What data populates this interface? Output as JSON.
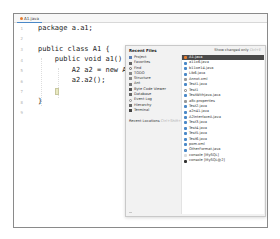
{
  "editor": {
    "tab_label": "A1.java",
    "line_numbers": [
      "1",
      "2",
      "3",
      "4",
      "5",
      "6",
      "7",
      "8",
      "9"
    ],
    "lines": [
      "package a.a1;",
      "",
      "public class A1 {",
      "    public void a1() ",
      "        A2 a2 = new A2();",
      "        a2.a2();",
      "    ",
      "}",
      ""
    ]
  },
  "popup": {
    "title": "Recent Files",
    "hint_label": "Show changed only",
    "hint_shortcut": "Ctrl+E",
    "left_items": [
      {
        "label": "Project",
        "icon": "project-icon",
        "color": "#5b7fb5"
      },
      {
        "label": "Favorites",
        "icon": "star-icon",
        "color": "#666666"
      },
      {
        "label": "Find",
        "icon": "search-icon",
        "color": "#666666"
      },
      {
        "label": "TODO",
        "icon": "todo-icon",
        "color": "#666666"
      },
      {
        "label": "Structure",
        "icon": "structure-icon",
        "color": "#666666"
      },
      {
        "label": "Ant",
        "icon": "ant-icon",
        "color": "#666666"
      },
      {
        "label": "Byte Code Viewer",
        "icon": "bytecode-icon",
        "color": "#666666"
      },
      {
        "label": "Database",
        "icon": "database-icon",
        "color": "#666666"
      },
      {
        "label": "Event Log",
        "icon": "event-log-icon",
        "color": "#888888"
      },
      {
        "label": "Hierarchy",
        "icon": "hierarchy-icon",
        "color": "#666666"
      },
      {
        "label": "Terminal",
        "icon": "terminal-icon",
        "color": "#444444"
      }
    ],
    "recent_locations_label": "Recent Locations",
    "recent_locations_shortcut": "Ctrl+Shift+E",
    "files": [
      {
        "name": "A1.java",
        "selected": true,
        "color": "#e57c2f"
      },
      {
        "name": "a11x6.java",
        "selected": false,
        "color": "#4a88c7"
      },
      {
        "name": "b11oe14.java",
        "selected": false,
        "color": "#4a88c7"
      },
      {
        "name": "Lib6.java",
        "selected": false,
        "color": "#4a88c7"
      },
      {
        "name": "Annot.xml",
        "selected": false,
        "color": "#999999"
      },
      {
        "name": "Test1.java",
        "selected": false,
        "color": "#4a88c7"
      },
      {
        "name": "Test1",
        "selected": false,
        "color": "#999999"
      },
      {
        "name": "TestWithjava.java",
        "selected": false,
        "color": "#4a88c7"
      },
      {
        "name": "a8c.properties",
        "selected": false,
        "color": "#999999"
      },
      {
        "name": "Test2.java",
        "selected": false,
        "color": "#4a88c7"
      },
      {
        "name": "a2n41.java",
        "selected": false,
        "color": "#4a88c7"
      },
      {
        "name": "A2InterfaceA.java",
        "selected": false,
        "color": "#4a88c7"
      },
      {
        "name": "Test3.java",
        "selected": false,
        "color": "#4a88c7"
      },
      {
        "name": "Test4.java",
        "selected": false,
        "color": "#4a88c7"
      },
      {
        "name": "Test5.java",
        "selected": false,
        "color": "#4a88c7"
      },
      {
        "name": "Test6.java",
        "selected": false,
        "color": "#4a88c7"
      },
      {
        "name": "pom.xml",
        "selected": false,
        "color": "#4a88c7"
      },
      {
        "name": "OtherFormat.java",
        "selected": false,
        "color": "#4a88c7"
      },
      {
        "name": "console [MySQL]",
        "selected": false,
        "color": "#bbbbbb"
      },
      {
        "name": "console [MySQL@2]",
        "selected": false,
        "color": "#333333"
      }
    ]
  }
}
